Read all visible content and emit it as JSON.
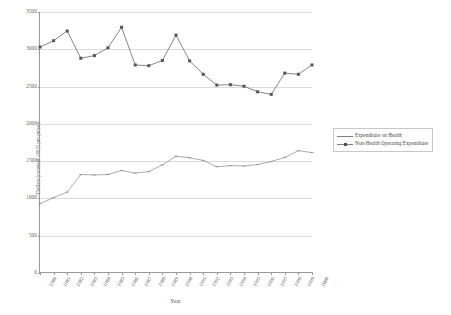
{
  "chart_data": {
    "type": "line",
    "title": "",
    "xlabel": "Year",
    "ylabel": "Dollars (constant 1992) per person",
    "ylim": [
      0,
      3500
    ],
    "ytick_values": [
      0,
      500,
      1000,
      1500,
      2000,
      2500,
      3000,
      3500
    ],
    "ytick_labels": [
      "0",
      "500",
      "1000",
      "1500",
      "2000",
      "2500",
      "3000",
      "3500"
    ],
    "grid": true,
    "legend_position": "right",
    "categories": [
      "1980",
      "1981",
      "1982",
      "1983",
      "1984",
      "1985",
      "1986",
      "1987",
      "1988",
      "1989",
      "1990",
      "1991",
      "1992",
      "1993",
      "1994",
      "1995",
      "1996",
      "1997",
      "1998",
      "1999",
      "2000"
    ],
    "series": [
      {
        "name": "Expenditure on Health",
        "marker": "tick",
        "color": "#8a8a8a",
        "values": [
          930,
          1010,
          1085,
          1320,
          1315,
          1320,
          1375,
          1340,
          1360,
          1450,
          1565,
          1545,
          1510,
          1425,
          1440,
          1435,
          1455,
          1495,
          1550,
          1640,
          1615
        ]
      },
      {
        "name": "Non-Health Operating Expenditure",
        "marker": "square",
        "color": "#555555",
        "values": [
          3030,
          3115,
          3245,
          2880,
          2915,
          3020,
          3295,
          2790,
          2780,
          2850,
          3190,
          2845,
          2665,
          2520,
          2525,
          2505,
          2430,
          2395,
          2680,
          2665,
          2790
        ]
      }
    ]
  },
  "legend": {
    "items": [
      {
        "label": "Expenditure on Health"
      },
      {
        "label": "Non-Health Operating Expenditure"
      }
    ]
  }
}
